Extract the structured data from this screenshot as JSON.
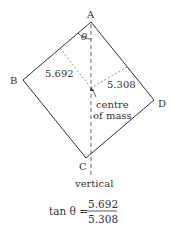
{
  "diagram": {
    "vertices": {
      "A": "A",
      "B": "B",
      "C": "C",
      "D": "D"
    },
    "angle_label": "θ",
    "distance_ab_side": "5.692",
    "distance_ad_side": "5.308",
    "cm_label_line1": "centre",
    "cm_label_line2": "of mass",
    "vertical_label": "vertical"
  },
  "equation": {
    "lhs": "tan θ =",
    "numerator": "5.692",
    "denominator": "5.308"
  },
  "colors": {
    "line": "#333333",
    "dashed": "#555555"
  }
}
